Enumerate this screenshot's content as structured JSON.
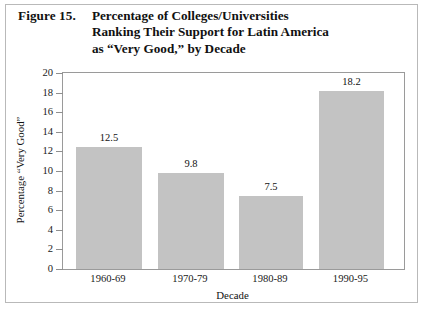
{
  "figure": {
    "number_label": "Figure 15.",
    "title_lines": [
      "Percentage of Colleges/Universities",
      "Ranking Their Support for Latin America",
      "as “Very Good,” by Decade"
    ]
  },
  "chart_data": {
    "type": "bar",
    "title": "Percentage of Colleges/Universities Ranking Their Support for Latin America as “Very Good,” by Decade",
    "categories": [
      "1960-69",
      "1970-79",
      "1980-89",
      "1990-95"
    ],
    "values": [
      12.5,
      9.8,
      7.5,
      18.2
    ],
    "value_labels": [
      "12.5",
      "9.8",
      "7.5",
      "18.2"
    ],
    "xlabel": "Decade",
    "ylabel": "Percentage “Very Good”",
    "ylim": [
      0,
      20
    ],
    "ytick_step": 2,
    "yticks": [
      "0",
      "2",
      "4",
      "6",
      "8",
      "10",
      "12",
      "14",
      "16",
      "18",
      "20"
    ],
    "grid": false,
    "legend": null,
    "bar_color": "#c3c3c3",
    "axis_color": "#9a9a9a",
    "text_color": "#111111"
  }
}
